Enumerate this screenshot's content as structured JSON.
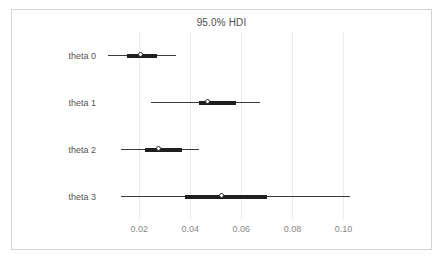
{
  "figure": {
    "title": "95.0% HDI",
    "background_color": "#ffffff",
    "frame_color": "#d4d4d4"
  },
  "chart_data": {
    "type": "scatter",
    "plot_style": "forest-plot-hdi-interval",
    "title": "95.0% HDI",
    "xlabel": "",
    "ylabel": "",
    "xlim": [
      0.00663,
      0.1096
    ],
    "grid": true,
    "grid_axis": "x",
    "legend": null,
    "x_ticks": [
      0.02,
      0.04,
      0.06,
      0.08,
      0.1
    ],
    "x_tick_labels": [
      "0.02",
      "0.04",
      "0.06",
      "0.08",
      "0.10"
    ],
    "categories": [
      "theta 0",
      "theta 1",
      "theta 2",
      "theta 3"
    ],
    "series": [
      {
        "name": "theta 0",
        "point_estimate": 0.0204,
        "hdi_94": [
          0.0078,
          0.0345
        ],
        "iqr": [
          0.0151,
          0.027
        ]
      },
      {
        "name": "theta 1",
        "point_estimate": 0.0468,
        "hdi_94": [
          0.0246,
          0.0672
        ],
        "iqr": [
          0.0435,
          0.0581
        ]
      },
      {
        "name": "theta 2",
        "point_estimate": 0.0275,
        "hdi_94": [
          0.0127,
          0.0434
        ],
        "iqr": [
          0.0222,
          0.0368
        ]
      },
      {
        "name": "theta 3",
        "point_estimate": 0.0523,
        "hdi_94": [
          0.0127,
          0.1025
        ],
        "iqr": [
          0.0378,
          0.07
        ]
      }
    ],
    "colors": {
      "hdi_line": "#3a3a3a",
      "iqr_bar": "#1f1f1f",
      "marker_face": "#ffffff",
      "marker_edge": "#2b2b2b",
      "gridline": "#ececec",
      "tick_text": "#888888",
      "label_text": "#555555",
      "title_text": "#4d4d4d"
    }
  }
}
